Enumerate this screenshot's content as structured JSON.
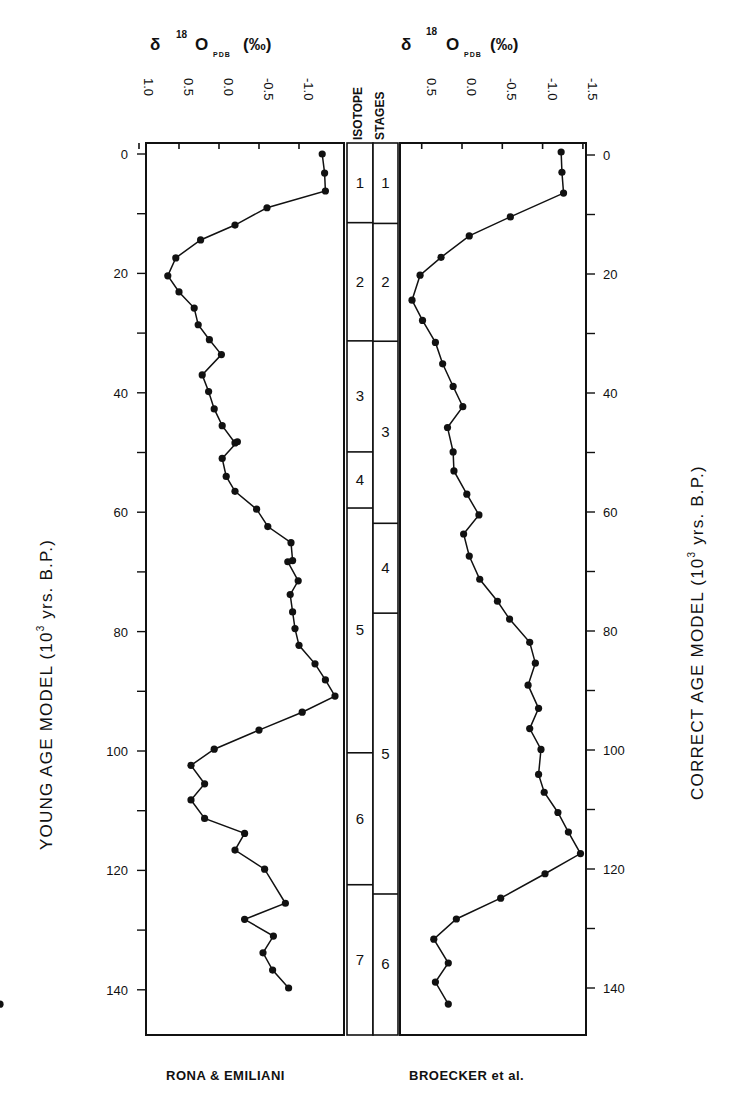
{
  "figure": {
    "left_panel": {
      "title": {
        "delta": "δ",
        "sup": "18",
        "element": "O",
        "sub": "PDB",
        "unit": "(‰)"
      },
      "source_label": "RONA & EMILIANI",
      "y_axis_title": {
        "pre": "YOUNG AGE MODEL (10",
        "sup": "3",
        "post": " yrs. B.P.)"
      }
    },
    "right_panel": {
      "title": {
        "delta": "δ",
        "sup": "18",
        "element": "O",
        "sub": "PDB",
        "unit": "(‰)"
      },
      "source_label": "BROECKER et al.",
      "y_axis_title": {
        "pre": "CORRECT AGE MODEL (10",
        "sup": "3",
        "post": " yrs. B.P.)"
      }
    },
    "stage_header": {
      "line1": "ISOTOPE",
      "line2": "STAGES"
    }
  },
  "chart_data": [
    {
      "type": "line",
      "title": "δ18O PDB (‰) — RONA & EMILIANI",
      "xlabel": "δ18O PDB (‰)",
      "ylabel": "YOUNG AGE MODEL (10^3 yrs. B.P.)",
      "x_ticks": [
        "1.0",
        "0.5",
        "0.0",
        "-0.5",
        "-1.0"
      ],
      "x_tick_values": [
        1.0,
        0.5,
        0.0,
        -0.5,
        -1.0
      ],
      "y_ticks": [
        "0",
        "20",
        "40",
        "60",
        "80",
        "100",
        "120",
        "140"
      ],
      "y_tick_values": [
        0,
        20,
        40,
        60,
        80,
        100,
        120,
        140
      ],
      "xlim": [
        1.0,
        -1.3
      ],
      "ylim": [
        0,
        148
      ],
      "x_axis_position": "top",
      "y_axis_inverted": true,
      "grid": false,
      "markers": "filled-circle",
      "series": [
        {
          "name": "RONA & EMILIANI",
          "age": [
            0,
            3.2,
            6.2,
            9,
            11.9,
            14.4,
            17.4,
            20.4,
            23.1,
            25.8,
            28.6,
            31.1,
            33.6,
            37,
            39.8,
            42.7,
            45.5,
            48.4,
            48.2,
            51,
            54,
            56.5,
            59.5,
            62.4,
            65.1,
            68.1,
            68.3,
            71.5,
            73.8,
            76.7,
            79.5,
            82.3,
            85.4,
            88.1,
            90.8,
            93.5,
            96.5,
            99.7,
            102.4,
            105.5,
            108.2,
            111.3,
            113.8,
            116.6,
            119.8,
            125.5,
            128.2,
            131,
            133.8,
            136.7,
            139.7,
            142.4
          ],
          "d18O": [
            -1.29,
            -1.32,
            -1.33,
            -0.6,
            -0.2,
            0.23,
            0.54,
            0.64,
            0.5,
            0.31,
            0.26,
            0.12,
            -0.03,
            0.21,
            0.13,
            0.06,
            -0.04,
            -0.2,
            -0.23,
            -0.04,
            -0.09,
            -0.2,
            -0.47,
            -0.61,
            -0.9,
            -0.92,
            -0.86,
            -0.99,
            -0.89,
            -0.92,
            -0.95,
            -1.0,
            -1.2,
            -1.33,
            -1.45,
            -1.04,
            -0.5,
            0.06,
            0.35,
            0.18,
            0.35,
            0.18,
            -0.32,
            -0.2,
            -0.57,
            -0.83,
            -0.32,
            -0.68,
            -0.55,
            -0.67,
            -0.87
          ],
          "note": "values estimated from point positions"
        }
      ]
    },
    {
      "type": "line",
      "title": "δ18O PDB (‰) — BROECKER et al.",
      "xlabel": "δ18O PDB (‰)",
      "ylabel": "CORRECT AGE MODEL (10^3 yrs. B.P.)",
      "x_ticks": [
        "0.5",
        "0.0",
        "-0.5",
        "-1.0",
        "-1.5"
      ],
      "x_tick_values": [
        0.5,
        0.0,
        -0.5,
        -1.0,
        -1.5
      ],
      "y_ticks": [
        "0",
        "20",
        "40",
        "60",
        "80",
        "100",
        "120",
        "140"
      ],
      "y_tick_values": [
        0,
        20,
        40,
        60,
        80,
        100,
        120,
        140
      ],
      "xlim": [
        0.75,
        -1.5
      ],
      "ylim": [
        0,
        150
      ],
      "x_axis_position": "top",
      "y_axis_inverted": true,
      "grid": false,
      "markers": "filled-circle",
      "series": [
        {
          "name": "BROECKER et al.",
          "age": [
            -0.5,
            2.9,
            6.4,
            10.4,
            13.6,
            17.2,
            20.2,
            24.4,
            27.8,
            31.5,
            35.1,
            38.9,
            42.3,
            45.8,
            49.9,
            53.1,
            57,
            60.5,
            63.7,
            67.4,
            71.3,
            75,
            78,
            81.9,
            85.4,
            89.1,
            93,
            96.4,
            99.9,
            104.1,
            107.1,
            110.5,
            113.8,
            117.4,
            120.8,
            124.9,
            128.4,
            131.8,
            135.8,
            139,
            142.7
          ],
          "d18O": [
            -1.23,
            -1.24,
            -1.26,
            -0.6,
            -0.09,
            0.26,
            0.52,
            0.62,
            0.49,
            0.33,
            0.24,
            0.11,
            -0.01,
            0.18,
            0.11,
            0.1,
            -0.06,
            -0.21,
            -0.02,
            -0.09,
            -0.22,
            -0.44,
            -0.59,
            -0.84,
            -0.91,
            -0.82,
            -0.95,
            -0.84,
            -0.98,
            -0.95,
            -1.02,
            -1.19,
            -1.32,
            -1.47,
            -1.03,
            -0.48,
            0.07,
            0.35,
            0.17,
            0.33,
            0.17
          ],
          "note": "values estimated from point positions"
        }
      ]
    },
    {
      "type": "table",
      "title": "ISOTOPE STAGES",
      "columns": [
        {
          "axis": "YOUNG AGE MODEL",
          "stages": [
            {
              "label": "1",
              "from": 0,
              "to": 11.5
            },
            {
              "label": "2",
              "from": 11.5,
              "to": 31.3
            },
            {
              "label": "3",
              "from": 31.3,
              "to": 49.9
            },
            {
              "label": "4",
              "from": 49.9,
              "to": 59.3
            },
            {
              "label": "5",
              "from": 59.3,
              "to": 100.3
            },
            {
              "label": "6",
              "from": 100.3,
              "to": 122.4
            },
            {
              "label": "7",
              "from": 122.4,
              "to": 148
            }
          ]
        },
        {
          "axis": "CORRECT AGE MODEL",
          "stages": [
            {
              "label": "1",
              "from": 0,
              "to": 11.5
            },
            {
              "label": "2",
              "from": 11.5,
              "to": 31.3
            },
            {
              "label": "3",
              "from": 31.3,
              "to": 61.9
            },
            {
              "label": "4",
              "from": 61.9,
              "to": 77
            },
            {
              "label": "5",
              "from": 77,
              "to": 124.2
            },
            {
              "label": "6",
              "from": 124.2,
              "to": 148
            }
          ]
        }
      ]
    }
  ],
  "render": {
    "left": {
      "box": [
        146,
        143,
        344,
        1035
      ],
      "x0_px": 219,
      "px_per_unit_x": -80,
      "y0_px": 154,
      "px_per_unit_y": 5.97,
      "age_tick_px_x": 146,
      "tick_label_x": 128,
      "xtick_label_y": 118
    },
    "right": {
      "box": [
        400,
        143,
        586,
        1035
      ],
      "x0_px": 462,
      "px_per_unit_x": -80.6,
      "y0_px": 155,
      "px_per_unit_y": 5.95,
      "age_tick_px_x": 586,
      "tick_label_x": 603,
      "xtick_label_y": 118
    },
    "stage_cols": [
      {
        "x1": 347,
        "x2": 373,
        "y0_px": 154,
        "px_per_unit_y": 5.97
      },
      {
        "x1": 373,
        "x2": 398,
        "y0_px": 155,
        "px_per_unit_y": 5.95
      }
    ],
    "marker_radius": 3.6
  }
}
